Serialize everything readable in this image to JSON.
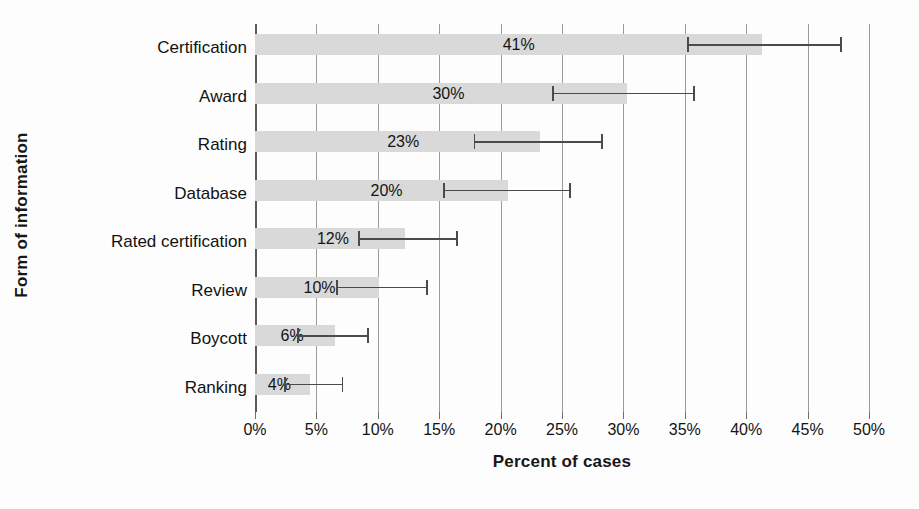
{
  "chart_data": {
    "type": "bar",
    "orientation": "horizontal",
    "title": "",
    "xlabel": "Percent of cases",
    "ylabel": "Form of information",
    "xlim": [
      0,
      50
    ],
    "ylim": null,
    "grid": true,
    "legend": null,
    "xticks": [
      "0%",
      "5%",
      "10%",
      "15%",
      "20%",
      "25%",
      "30%",
      "35%",
      "40%",
      "45%",
      "50%"
    ],
    "xtick_values": [
      0,
      5,
      10,
      15,
      20,
      25,
      30,
      35,
      40,
      45,
      50
    ],
    "categories": [
      "Certification",
      "Award",
      "Rating",
      "Database",
      "Rated certification",
      "Review",
      "Boycott",
      "Ranking"
    ],
    "values": [
      41,
      30,
      23,
      20,
      12,
      10,
      6,
      4
    ],
    "data_labels": [
      "41%",
      "30%",
      "23%",
      "20%",
      "12%",
      "10%",
      "6%",
      "4%"
    ],
    "error_bars": {
      "type": "confidence-interval",
      "lower": [
        35.2,
        24.2,
        17.8,
        15.3,
        8.4,
        6.6,
        3.4,
        2.4
      ],
      "upper": [
        47.8,
        35.8,
        28.3,
        25.7,
        16.5,
        14.1,
        9.3,
        7.2
      ]
    },
    "bar_values_plotted": [
      41.3,
      30.3,
      23.2,
      20.6,
      12.2,
      10.1,
      6.5,
      4.5
    ],
    "colors": {
      "bar_fill": "#d9d9d9",
      "error_bar": "#4b4b4b",
      "gridline": "#9a9a9a",
      "axis": "#5a5a5a",
      "text": "#141414",
      "background": "#fdfdfd"
    }
  }
}
